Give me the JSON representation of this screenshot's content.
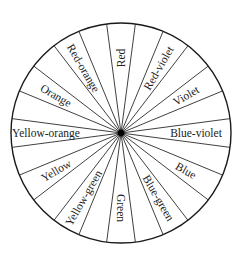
{
  "diagram": {
    "center": {
      "x": 121,
      "y": 133
    },
    "radius": 110,
    "label_radius": 75,
    "hub_radius": 3.2,
    "spoke_count": 24,
    "colors": {
      "line": "#2a2a2a",
      "text": "#222222",
      "background": "#ffffff",
      "hub": "#000000"
    },
    "segments": [
      {
        "label": "Red",
        "angle_deg": 0
      },
      {
        "label": "Red-violet",
        "angle_deg": 30
      },
      {
        "label": "Violet",
        "angle_deg": 60
      },
      {
        "label": "Blue-violet",
        "angle_deg": 90
      },
      {
        "label": "Blue",
        "angle_deg": 120
      },
      {
        "label": "Blue-green",
        "angle_deg": 150
      },
      {
        "label": "Green",
        "angle_deg": 180
      },
      {
        "label": "Yellow-green",
        "angle_deg": 210
      },
      {
        "label": "Yellow",
        "angle_deg": 240
      },
      {
        "label": "Yellow-orange",
        "angle_deg": 270
      },
      {
        "label": "Orange",
        "angle_deg": 300
      },
      {
        "label": "Red-orange",
        "angle_deg": 330
      }
    ]
  }
}
